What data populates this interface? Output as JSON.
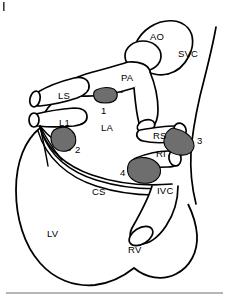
{
  "figure": {
    "type": "anatomical-diagram",
    "background_color": "#ffffff",
    "line_color": "#000000",
    "lesion_color": "#6e6e6e"
  },
  "labels": {
    "ao": "AO",
    "svc": "SVC",
    "pa": "PA",
    "ls": "LS",
    "l1": "L1",
    "la": "LA",
    "rs": "RS",
    "ri": "RI",
    "ivc": "IVC",
    "cs": "CS",
    "lv": "LV",
    "rv": "RV"
  },
  "lesion_markers": {
    "one": "1",
    "two": "2",
    "three": "3",
    "four": "4"
  }
}
